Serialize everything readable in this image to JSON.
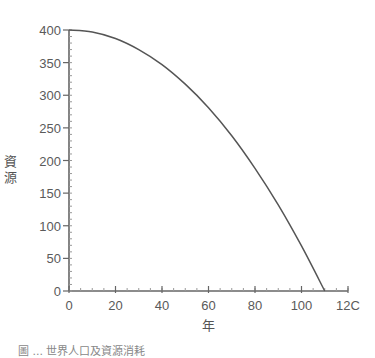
{
  "chart_data": {
    "type": "line",
    "title": "",
    "xlabel": "年",
    "ylabel": "資源",
    "xlim": [
      0,
      120
    ],
    "ylim": [
      0,
      400
    ],
    "x_ticks": [
      0,
      20,
      40,
      60,
      80,
      100,
      120
    ],
    "x_tick_labels": [
      "0",
      "20",
      "40",
      "60",
      "80",
      "100",
      "12C"
    ],
    "y_ticks": [
      0,
      50,
      100,
      150,
      200,
      250,
      300,
      350,
      400
    ],
    "y_tick_labels": [
      "0",
      "50",
      "100",
      "150",
      "200",
      "250",
      "300",
      "350",
      "400"
    ],
    "x_minor_step": 5,
    "y_minor_step": 10,
    "grid": false,
    "legend": null,
    "series": [
      {
        "name": "資源",
        "x": [
          0,
          10,
          20,
          30,
          40,
          50,
          60,
          70,
          80,
          90,
          100,
          110
        ],
        "values": [
          400,
          397,
          387,
          370,
          347,
          317,
          281,
          238,
          188,
          132,
          69,
          0
        ]
      }
    ],
    "colors": {
      "line": "#555555",
      "axis": "#666666",
      "text": "#5a5a5a"
    }
  },
  "caption": "圖 ...  世界人口及資源消耗"
}
